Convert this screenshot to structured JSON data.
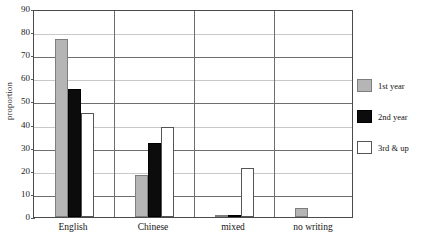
{
  "chart_data": {
    "type": "bar",
    "title": "",
    "xlabel": "",
    "ylabel": "proportion",
    "ylim": [
      0,
      90
    ],
    "ytick_step": 10,
    "yticks": [
      "90",
      "80",
      "70",
      "60",
      "50",
      "40",
      "30",
      "20",
      "10",
      "0"
    ],
    "grid": true,
    "legend_position": "right",
    "categories": [
      "English",
      "Chinese",
      "mixed",
      "no writing"
    ],
    "series": [
      {
        "name": "1st year",
        "color": "#b5b5b5",
        "values": [
          77,
          18,
          1,
          4
        ]
      },
      {
        "name": "2nd year",
        "color": "#0c0c0c",
        "values": [
          55.5,
          32,
          1,
          0
        ]
      },
      {
        "name": "3rd & up",
        "color": "#ffffff",
        "values": [
          45,
          39,
          21,
          0
        ]
      }
    ]
  },
  "legend": {
    "entries": [
      {
        "label": "1st year"
      },
      {
        "label": "2nd year"
      },
      {
        "label": "3rd & up"
      }
    ]
  }
}
